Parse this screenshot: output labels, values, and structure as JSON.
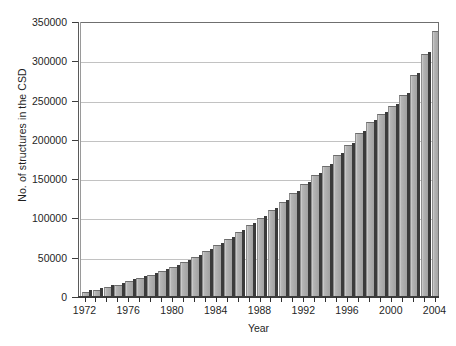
{
  "chart_data": {
    "type": "bar",
    "title": "",
    "xlabel": "Year",
    "ylabel": "No. of structures in the CSD",
    "ylim": [
      0,
      350000
    ],
    "xlim": [
      1972,
      2004
    ],
    "grid": true,
    "legend": false,
    "legend_position": "none",
    "y_ticks": [
      0,
      50000,
      100000,
      150000,
      200000,
      250000,
      300000,
      350000
    ],
    "y_tick_labels": [
      "0",
      "50000",
      "100000",
      "150000",
      "200000",
      "250000",
      "300000",
      "350000"
    ],
    "x_ticks": [
      1972,
      1976,
      1980,
      1984,
      1988,
      1992,
      1996,
      2000,
      2004
    ],
    "x_tick_labels": [
      "1972",
      "1976",
      "1980",
      "1984",
      "1988",
      "1992",
      "1996",
      "2000",
      "2004"
    ],
    "x_minor_ticks_every": 1,
    "bar_color": "#ababab",
    "bar_edge_color": "#3b3b3b",
    "grid_color": "#c2c2c2",
    "categories": [
      "1972",
      "1973",
      "1974",
      "1975",
      "1976",
      "1977",
      "1978",
      "1979",
      "1980",
      "1981",
      "1982",
      "1983",
      "1984",
      "1985",
      "1986",
      "1987",
      "1988",
      "1989",
      "1990",
      "1991",
      "1992",
      "1993",
      "1994",
      "1995",
      "1996",
      "1997",
      "1998",
      "1999",
      "2000",
      "2001",
      "2002",
      "2003",
      "2004"
    ],
    "values": [
      5000,
      8000,
      11000,
      14500,
      18500,
      22500,
      27000,
      32000,
      37500,
      43500,
      50000,
      57000,
      64500,
      72500,
      81000,
      90000,
      99500,
      109500,
      120000,
      131000,
      142500,
      154000,
      166000,
      179000,
      192500,
      207000,
      222000,
      232000,
      242000,
      256000,
      281000,
      308000,
      337000
    ],
    "series": [
      {
        "name": "No. of structures in the CSD",
        "values": [
          5000,
          8000,
          11000,
          14500,
          18500,
          22500,
          27000,
          32000,
          37500,
          43500,
          50000,
          57000,
          64500,
          72500,
          81000,
          90000,
          99500,
          109500,
          120000,
          131000,
          142500,
          154000,
          166000,
          179000,
          192500,
          207000,
          222000,
          232000,
          242000,
          256000,
          281000,
          308000,
          337000
        ]
      }
    ]
  }
}
